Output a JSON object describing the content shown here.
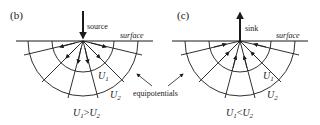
{
  "panels": [
    {
      "id": "b",
      "label": "(b)",
      "point_label": "source",
      "surface_label": "surface",
      "inner_label": "U",
      "inner_sub": "1",
      "outer_label": "U",
      "outer_sub": "2",
      "relation": {
        "a": "U",
        "a_sub": "1",
        "op": ">",
        "b": "U",
        "b_sub": "2"
      },
      "flow_direction": "outward"
    },
    {
      "id": "c",
      "label": "(c)",
      "point_label": "sink",
      "surface_label": "surface",
      "inner_label": "U",
      "inner_sub": "1",
      "outer_label": "U",
      "outer_sub": "2",
      "relation": {
        "a": "U",
        "a_sub": "1",
        "op": "<",
        "b": "U",
        "b_sub": "2"
      },
      "flow_direction": "inward"
    }
  ],
  "shared": {
    "equipotentials_label": "equipotentials"
  },
  "colors": {
    "ink": "#1a1a1a",
    "background": "#ffffff"
  }
}
